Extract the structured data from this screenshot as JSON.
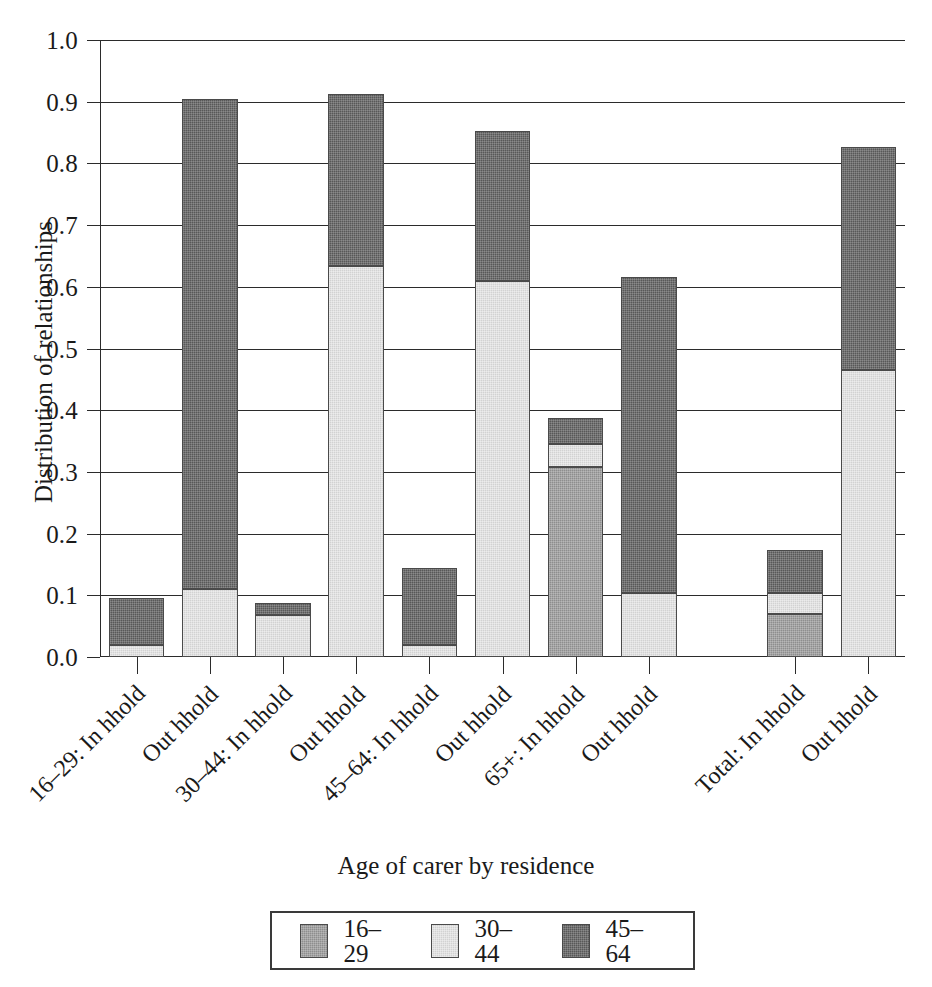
{
  "chart_data": {
    "type": "bar",
    "subtype": "stacked-bar",
    "title": "",
    "xlabel": "Age of carer by residence",
    "ylabel": "Distribution of relationships",
    "ylim": [
      0.0,
      1.0
    ],
    "ytick_labels": [
      "0.0",
      "0.1",
      "0.2",
      "0.3",
      "0.4",
      "0.5",
      "0.6",
      "0.7",
      "0.8",
      "0.9",
      "1.0"
    ],
    "ytick_values": [
      0.0,
      0.1,
      0.2,
      0.3,
      0.4,
      0.5,
      0.6,
      0.7,
      0.8,
      0.9,
      1.0
    ],
    "grid": true,
    "grid_axis": "y",
    "legend_position": "bottom",
    "categories": [
      "16–29: In hhold",
      "Out hhold",
      "30–44: In hhold",
      "Out hhold",
      "45–64: In hhold",
      "Out hhold",
      "65+: In hhold",
      "Out hhold",
      "Total: In hhold",
      "Out hhold"
    ],
    "series": [
      {
        "name": "16–29",
        "color": "#8e8e8e",
        "values": [
          0.0,
          0.0,
          0.0,
          0.0,
          0.0,
          0.0,
          0.308,
          0.0,
          0.07,
          0.0
        ]
      },
      {
        "name": "30–44",
        "color": "#d2d2d2",
        "values": [
          0.02,
          0.11,
          0.068,
          0.633,
          0.02,
          0.61,
          0.038,
          0.103,
          0.034,
          0.465
        ]
      },
      {
        "name": "45–64",
        "color": "#585858",
        "values": [
          0.075,
          0.794,
          0.02,
          0.279,
          0.124,
          0.243,
          0.042,
          0.513,
          0.07,
          0.361
        ]
      }
    ],
    "totals": [
      0.095,
      0.904,
      0.088,
      0.912,
      0.144,
      0.853,
      0.388,
      0.616,
      0.174,
      0.826
    ],
    "gap_after_index": 7
  },
  "axes": {
    "y_title": "Distribution of relationships",
    "x_title": "Age of carer by residence",
    "y_ticks": [
      "1.0",
      "0.9",
      "0.8",
      "0.7",
      "0.6",
      "0.5",
      "0.4",
      "0.3",
      "0.2",
      "0.1",
      "0.0"
    ]
  },
  "legend": {
    "items": [
      {
        "label": "16–29",
        "swatch": "#8e8e8e"
      },
      {
        "label": "30–44",
        "swatch": "#d2d2d2"
      },
      {
        "label": "45–64",
        "swatch": "#585858"
      }
    ]
  },
  "x_labels": [
    "16–29: In hhold",
    "Out hhold",
    "30–44: In hhold",
    "Out hhold",
    "45–64: In hhold",
    "Out hhold",
    "65+: In hhold",
    "Out hhold",
    "Total: In hhold",
    "Out hhold"
  ],
  "colors": {
    "axis": "#2b2b2b",
    "grid": "#2b2b2b",
    "background": "#ffffff",
    "series_16_29": "#8e8e8e",
    "series_30_44": "#d2d2d2",
    "series_45_64": "#585858"
  }
}
